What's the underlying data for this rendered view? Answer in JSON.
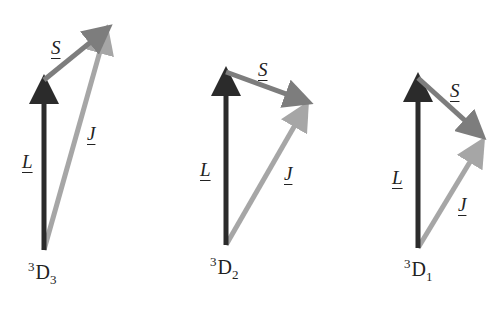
{
  "colors": {
    "L": "#2b2b2b",
    "S": "#7d7d7d",
    "J": "#a6a6a6",
    "text": "#222222"
  },
  "diagrams": [
    {
      "term": {
        "multiplicity": "3",
        "letter": "D",
        "J": "3"
      },
      "labels": {
        "L": "L",
        "S": "S",
        "J": "J"
      },
      "geometry": {
        "base": [
          44,
          250
        ],
        "L_tip": [
          44,
          80
        ],
        "S_tip": [
          108,
          28
        ],
        "J_tip": [
          106,
          30
        ]
      },
      "label_pos": {
        "S": [
          51,
          38
        ],
        "L": [
          22,
          152
        ],
        "J": [
          87,
          124
        ],
        "term": [
          28,
          260
        ]
      }
    },
    {
      "term": {
        "multiplicity": "3",
        "letter": "D",
        "J": "2"
      },
      "labels": {
        "L": "L",
        "S": "S",
        "J": "J"
      },
      "geometry": {
        "base": [
          226,
          245
        ],
        "L_tip": [
          226,
          72
        ],
        "S_tip": [
          308,
          102
        ],
        "J_tip": [
          306,
          106
        ]
      },
      "label_pos": {
        "S": [
          258,
          60
        ],
        "L": [
          200,
          160
        ],
        "J": [
          284,
          164
        ],
        "term": [
          210,
          255
        ]
      }
    },
    {
      "term": {
        "multiplicity": "3",
        "letter": "D",
        "J": "1"
      },
      "labels": {
        "L": "L",
        "S": "S",
        "J": "J"
      },
      "geometry": {
        "base": [
          418,
          248
        ],
        "L_tip": [
          418,
          78
        ],
        "S_tip": [
          482,
          136
        ],
        "J_tip": [
          482,
          142
        ]
      },
      "label_pos": {
        "S": [
          450,
          81
        ],
        "L": [
          392,
          168
        ],
        "J": [
          458,
          195
        ],
        "term": [
          404,
          257
        ]
      }
    }
  ]
}
